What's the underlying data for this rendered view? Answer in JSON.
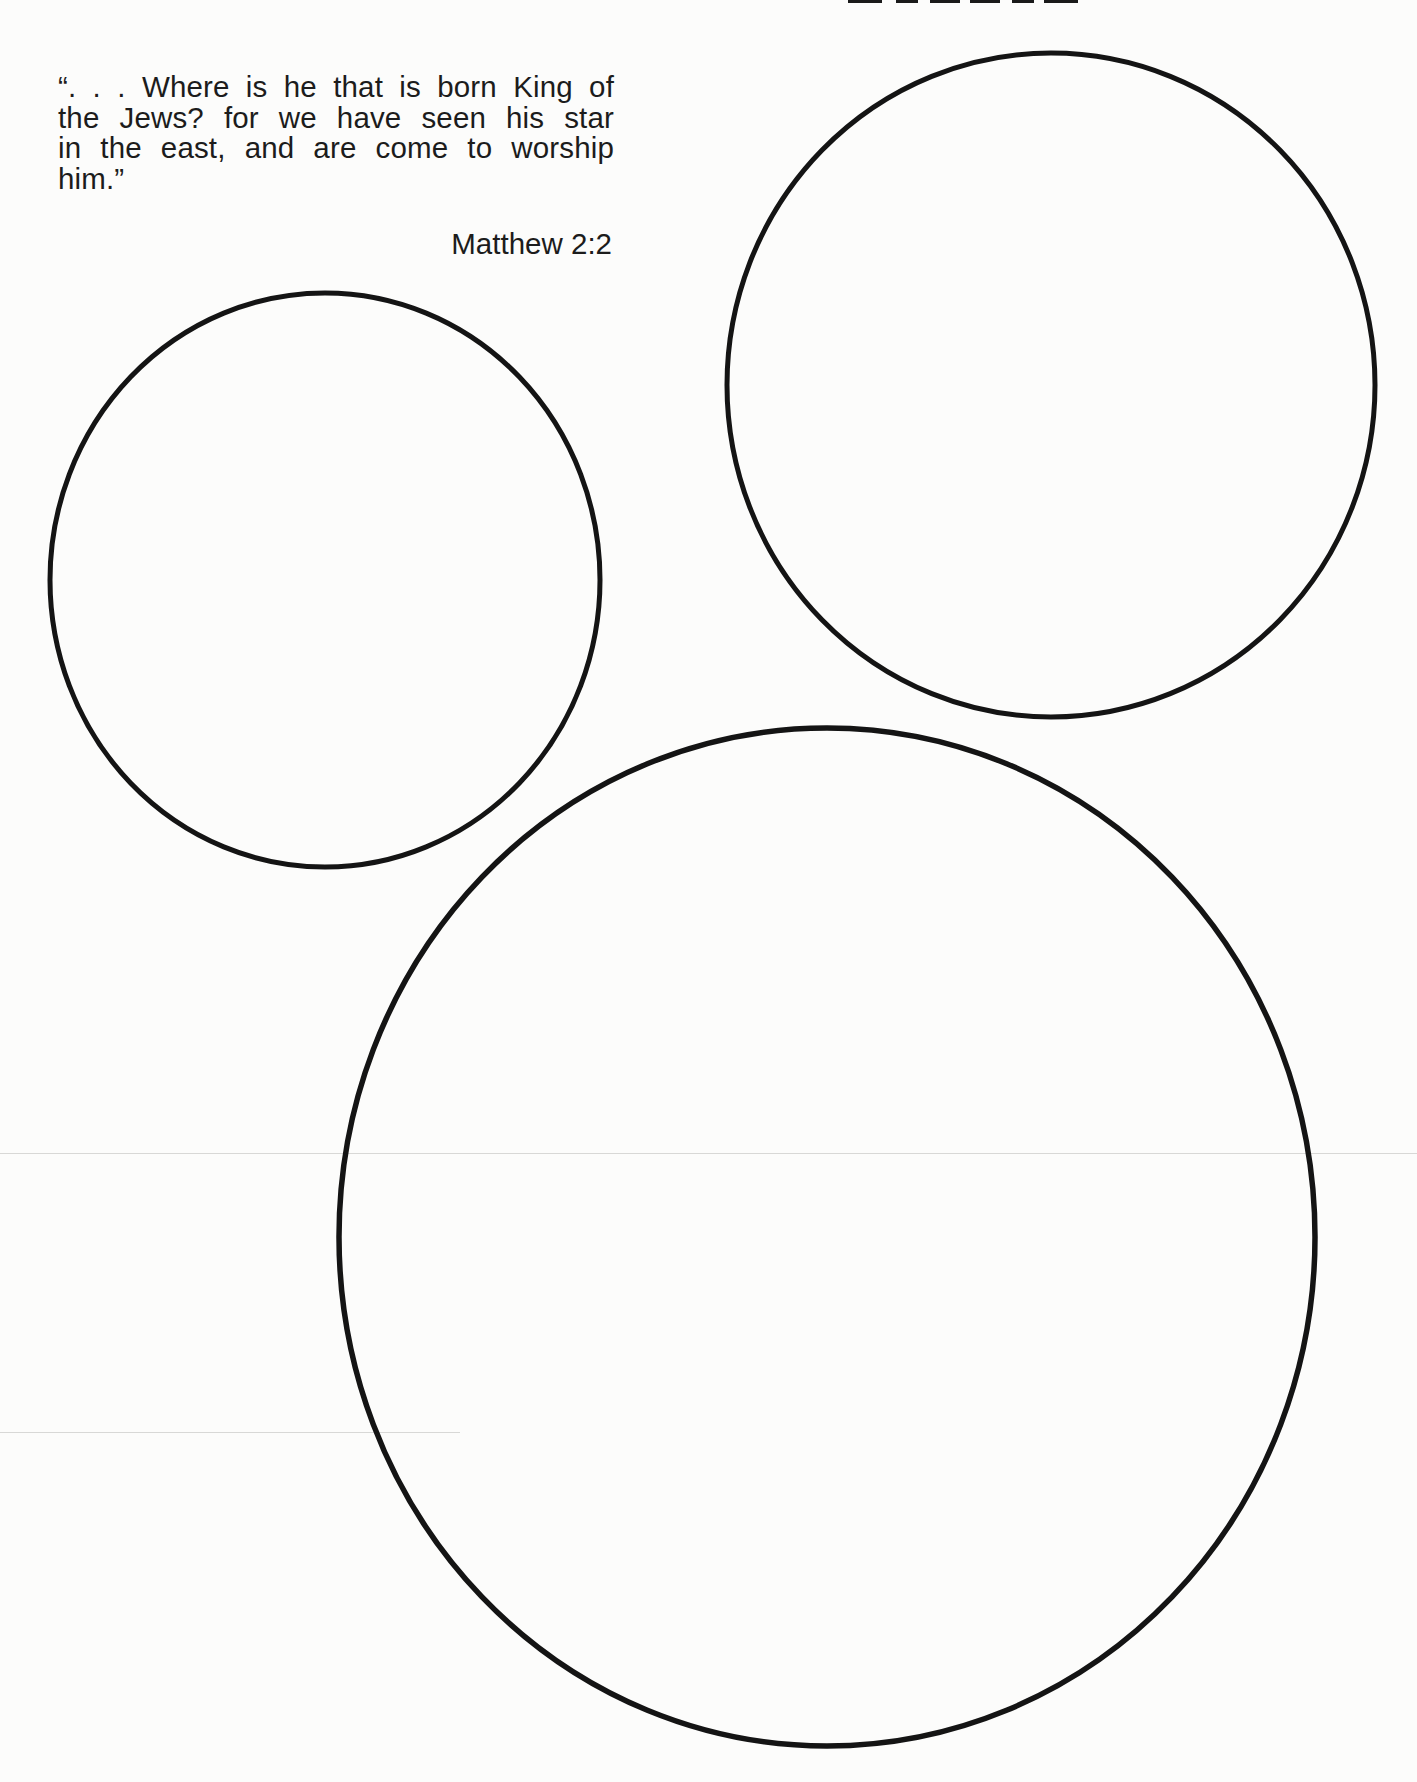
{
  "page": {
    "background": "#fcfcfb",
    "ink_color": "#141414"
  },
  "header": {
    "clipped_title_note": ""
  },
  "quote": {
    "lines": [
      "“. . . Where is he that is born King of",
      "the Jews? for we have seen his star",
      "in the east, and are come to worship",
      "him.”"
    ],
    "citation": "Matthew 2:2"
  },
  "circles": [
    {
      "name": "small-circle-left",
      "cx": 325,
      "cy": 580,
      "rx": 275,
      "ry": 287
    },
    {
      "name": "medium-circle-top-right",
      "cx": 1051,
      "cy": 385,
      "rx": 324,
      "ry": 332
    },
    {
      "name": "large-circle-bottom",
      "cx": 827,
      "cy": 1237,
      "rx": 488,
      "ry": 509
    }
  ]
}
